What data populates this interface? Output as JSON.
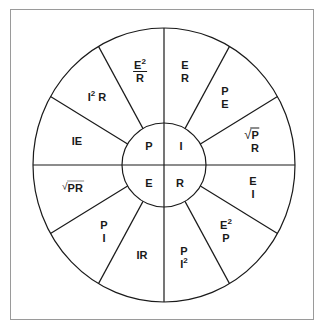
{
  "diagram": {
    "colors": {
      "line": "#1a1a1a",
      "frame": "#9a9a9a",
      "background": "#ffffff"
    },
    "inner": {
      "top_left": "P",
      "top_right": "I",
      "bottom_left": "E",
      "bottom_right": "R"
    },
    "segments": {
      "e2_over_r": {
        "num": "E",
        "sup": "2",
        "den": "R"
      },
      "e_over_r": {
        "num": "E",
        "den": "R"
      },
      "p_over_e": {
        "num": "P",
        "den": "E"
      },
      "sqrt_p_over_r": {
        "radical": "√",
        "num": "P",
        "den": "R"
      },
      "e_over_i": {
        "num": "E",
        "den": "I"
      },
      "e2_over_p": {
        "num": "E",
        "sup": "2",
        "den": "P"
      },
      "p_over_i2": {
        "num": "P",
        "den": "I",
        "den_sup": "2"
      },
      "ir": {
        "text": "IR"
      },
      "p_over_i": {
        "num": "P",
        "den": "I"
      },
      "sqrt_pr": {
        "radical": "√",
        "text": "PR"
      },
      "ie": {
        "text": "IE"
      },
      "i2r": {
        "base": "I",
        "sup": "2",
        "tail": " R"
      }
    }
  }
}
